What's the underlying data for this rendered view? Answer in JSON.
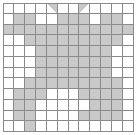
{
  "figure": {
    "name": "grid-pattern",
    "type": "pixel-grid",
    "columns": 12,
    "rows": 12,
    "cell_fill_color": "#c9c9c9",
    "cell_empty_color": "#ffffff",
    "grid_line_color": "#8a8a8a",
    "background_color": "#ffffff"
  },
  "chart_data": {
    "type": "heatmap",
    "title": "",
    "xlabel": "",
    "ylabel": "",
    "categories": [
      "1",
      "2",
      "3",
      "4",
      "5",
      "6",
      "7",
      "8",
      "9",
      "10",
      "11",
      "12"
    ],
    "row_labels": [
      "1",
      "2",
      "3",
      "4",
      "5",
      "6",
      "7",
      "8",
      "9",
      "10",
      "11",
      "12"
    ],
    "legend": [],
    "grid": true,
    "values": [
      [
        0,
        0,
        0,
        0,
        0,
        0,
        0,
        0,
        0,
        0,
        0,
        0
      ],
      [
        0,
        1,
        1,
        0,
        0,
        1,
        1,
        1,
        0,
        1,
        1,
        0
      ],
      [
        1,
        1,
        1,
        1,
        1,
        1,
        1,
        1,
        1,
        1,
        1,
        1
      ],
      [
        0,
        0,
        1,
        1,
        1,
        1,
        1,
        1,
        1,
        1,
        1,
        0
      ],
      [
        0,
        0,
        0,
        1,
        1,
        1,
        1,
        1,
        1,
        1,
        0,
        0
      ],
      [
        0,
        0,
        0,
        1,
        1,
        1,
        1,
        1,
        1,
        1,
        0,
        0
      ],
      [
        0,
        0,
        0,
        1,
        1,
        1,
        1,
        1,
        1,
        1,
        0,
        0
      ],
      [
        0,
        0,
        1,
        1,
        1,
        1,
        1,
        1,
        1,
        1,
        1,
        0
      ],
      [
        0,
        1,
        1,
        1,
        0,
        0,
        0,
        1,
        1,
        1,
        1,
        0
      ],
      [
        0,
        1,
        1,
        0,
        0,
        0,
        0,
        0,
        1,
        1,
        1,
        0
      ],
      [
        0,
        1,
        1,
        0,
        0,
        0,
        0,
        1,
        1,
        1,
        1,
        0
      ],
      [
        0,
        0,
        1,
        0,
        0,
        0,
        0,
        0,
        0,
        0,
        0,
        0
      ]
    ],
    "accents": [
      {
        "row": 0,
        "col": 4,
        "shape": "triangle-left-down"
      },
      {
        "row": 0,
        "col": 7,
        "shape": "triangle-right-down"
      }
    ]
  }
}
